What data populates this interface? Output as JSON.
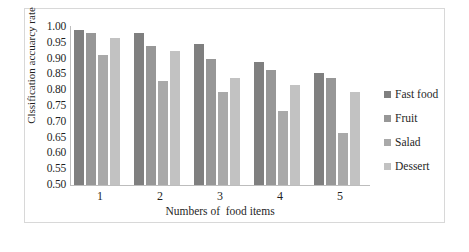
{
  "chart_data": {
    "type": "bar",
    "title": "",
    "subtitle": "",
    "xlabel": "Numbers of  food items",
    "ylabel": "Clssification accuarcy rate",
    "categories": [
      "1",
      "2",
      "3",
      "4",
      "5"
    ],
    "series": [
      {
        "name": "Fast food",
        "color": "#7f7f7f",
        "values": [
          0.99,
          0.98,
          0.945,
          0.89,
          0.855
        ]
      },
      {
        "name": "Fruit",
        "color": "#979797",
        "values": [
          0.98,
          0.94,
          0.9,
          0.865,
          0.84
        ]
      },
      {
        "name": "Salad",
        "color": "#a9a9a9",
        "values": [
          0.91,
          0.83,
          0.795,
          0.735,
          0.665
        ]
      },
      {
        "name": "Dessert",
        "color": "#c2c2c2",
        "values": [
          0.965,
          0.925,
          0.84,
          0.815,
          0.795
        ]
      }
    ],
    "ylim": [
      0.5,
      1.0
    ],
    "ytick_step": 0.05,
    "ytick_labels": [
      "1.00",
      "0.95",
      "0.90",
      "0.85",
      "0.80",
      "0.75",
      "0.70",
      "0.65",
      "0.60",
      "0.55",
      "0.50"
    ],
    "grid": false,
    "legend_position": "right"
  },
  "legend": {
    "items": [
      {
        "label": "Fast food",
        "color": "#7f7f7f"
      },
      {
        "label": "Fruit",
        "color": "#979797"
      },
      {
        "label": "Salad",
        "color": "#a9a9a9"
      },
      {
        "label": "Dessert",
        "color": "#c2c2c2"
      }
    ]
  }
}
